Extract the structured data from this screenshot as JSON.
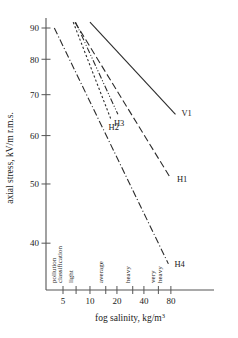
{
  "chart_data": {
    "type": "line",
    "title": "",
    "xlabel": "fog salinity, kg/m3",
    "xlabel_base": "fog salinity, kg/m",
    "xlabel_sup": "3",
    "ylabel": "axial stress, kV/m r.m.s.",
    "xscale": "log",
    "yscale": "log",
    "xlim": [
      3.5,
      100
    ],
    "ylim": [
      33,
      100
    ],
    "xticks": [
      5,
      10,
      20,
      40,
      80
    ],
    "xtick_labels": [
      "5",
      "10",
      "20",
      "40",
      "80"
    ],
    "yticks": [
      40,
      50,
      60,
      70,
      80,
      90
    ],
    "ytick_labels": [
      "40",
      "50",
      "60",
      "70",
      "80",
      "90"
    ],
    "grid": false,
    "legend": "inline-end-labels",
    "classification_axis_label": [
      "pollution",
      "classification"
    ],
    "classification_bands": [
      {
        "label": "light",
        "x": 7
      },
      {
        "label": "average",
        "x": 15
      },
      {
        "label": "heavy",
        "x": 30
      },
      {
        "label": "very heavy",
        "x": 58,
        "lines": [
          "very",
          "heavy"
        ]
      }
    ],
    "series": [
      {
        "name": "V1",
        "label": "V1",
        "style": "solid",
        "color": "#2b2b2b",
        "points": [
          [
            10,
            92.0
          ],
          [
            90,
            65.0
          ]
        ]
      },
      {
        "name": "H1",
        "label": "H1",
        "style": "long-dash",
        "color": "#2b2b2b",
        "points": [
          [
            6.8,
            92.0
          ],
          [
            80,
            51.0
          ]
        ]
      },
      {
        "name": "H2",
        "label": "H2",
        "style": "fine-dash",
        "color": "#2b2b2b",
        "points": [
          [
            6.5,
            92.0
          ],
          [
            17,
            64.0
          ]
        ]
      },
      {
        "name": "H3",
        "label": "H3",
        "style": "dash-dot-dot",
        "color": "#2b2b2b",
        "points": [
          [
            6.9,
            92.0
          ],
          [
            20.5,
            65.0
          ]
        ]
      },
      {
        "name": "H4",
        "label": "H4",
        "style": "dash-dot",
        "color": "#2b2b2b",
        "points": [
          [
            4.0,
            90.0
          ],
          [
            75,
            37.0
          ]
        ]
      }
    ],
    "series_labels": [
      {
        "name": "V1",
        "text": "V1"
      },
      {
        "name": "H1",
        "text": "H1"
      },
      {
        "name": "H2",
        "text": "H2"
      },
      {
        "name": "H3",
        "text": "H3"
      },
      {
        "name": "H4",
        "text": "H4"
      }
    ]
  }
}
